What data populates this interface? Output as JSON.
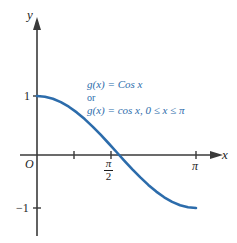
{
  "figure": {
    "background_color": "#ffffff"
  },
  "axes": {
    "x_label": "x",
    "y_label": "y",
    "origin_label": "O",
    "axis_color": "#3a3a3a"
  },
  "ticks": {
    "y": [
      {
        "value": 1,
        "label": "1"
      },
      {
        "value": -1,
        "label": "−1"
      }
    ],
    "x": [
      {
        "value": 0.7853981634,
        "label": ""
      },
      {
        "value": 1.5707963268,
        "label_numerator": "π",
        "label_denominator": "2"
      },
      {
        "value": 3.1415926536,
        "label": "π"
      }
    ]
  },
  "annotation": {
    "color": "#2c6cab",
    "line1": "g(x)  =  Cos x",
    "line2": "or",
    "line3": "g(x)  =  cos x, 0 ≤ x ≤ π"
  },
  "chart_data": {
    "type": "line",
    "title": "",
    "xlabel": "x",
    "ylabel": "y",
    "grid": false,
    "legend": "none",
    "xlim": [
      -0.35,
      3.6
    ],
    "ylim": [
      -1.45,
      1.55
    ],
    "series": [
      {
        "name": "g(x) = Cos x",
        "color": "#2c6cab",
        "domain": [
          0,
          3.1415926536
        ],
        "x": [
          0,
          0.1570796,
          0.3141593,
          0.4712389,
          0.6283185,
          0.7853982,
          0.9424778,
          1.0995574,
          1.2566371,
          1.4137167,
          1.5707963,
          1.727876,
          1.8849556,
          2.0420352,
          2.1991149,
          2.3561945,
          2.5132741,
          2.6703538,
          2.8274334,
          2.984513,
          3.1415927
        ],
        "y": [
          1.0,
          0.9877,
          0.9511,
          0.891,
          0.809,
          0.7071,
          0.5878,
          0.454,
          0.309,
          0.1564,
          0.0,
          -0.1564,
          -0.309,
          -0.454,
          -0.5878,
          -0.7071,
          -0.809,
          -0.891,
          -0.9511,
          -0.9877,
          -1.0
        ]
      }
    ],
    "axis_ticks_x": [
      "",
      "π/2",
      "π"
    ],
    "axis_ticks_y": [
      "1",
      "−1"
    ],
    "annotations": [
      "g(x) = Cos x",
      "or",
      "g(x) = cos x, 0 ≤ x ≤ π"
    ]
  }
}
